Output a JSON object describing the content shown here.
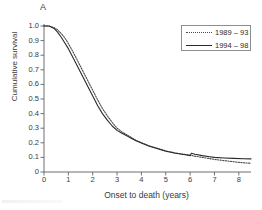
{
  "figure": {
    "panel_letter": "A"
  },
  "chart_data": {
    "type": "line",
    "title": "",
    "panel": "A",
    "xlabel": "Onset to death (years)",
    "ylabel": "Cumulative survival",
    "xlim": [
      0,
      8.5
    ],
    "ylim": [
      0,
      1.0
    ],
    "grid": false,
    "legend_position": "top-right",
    "xticks": [
      "0",
      "1",
      "2",
      "3",
      "4",
      "5",
      "6",
      "7",
      "8"
    ],
    "xtick_values": [
      0,
      1,
      2,
      3,
      4,
      5,
      6,
      7,
      8
    ],
    "yticks": [
      "0",
      "0.1",
      "0.2",
      "0.3",
      "0.4",
      "0.5",
      "0.6",
      "0.7",
      "0.8",
      "0.9",
      "1.0"
    ],
    "ytick_values": [
      0,
      0.1,
      0.2,
      0.3,
      0.4,
      0.5,
      0.6,
      0.7,
      0.8,
      0.9,
      1.0
    ],
    "series": [
      {
        "name": "1989 – 93",
        "style": "dotted",
        "color": "#4a4a4a",
        "x": [
          0,
          0.2,
          0.4,
          0.55,
          0.7,
          0.85,
          1.0,
          1.2,
          1.4,
          1.6,
          1.8,
          2.0,
          2.2,
          2.4,
          2.6,
          2.8,
          3.0,
          3.2,
          3.4,
          3.6,
          3.8,
          4.0,
          4.3,
          4.6,
          5.0,
          5.4,
          5.8,
          6.0,
          6.2,
          6.5,
          6.8,
          7.0,
          7.4,
          7.8,
          8.2,
          8.5
        ],
        "y": [
          1.0,
          1.0,
          0.99,
          0.975,
          0.95,
          0.92,
          0.88,
          0.82,
          0.755,
          0.69,
          0.625,
          0.56,
          0.495,
          0.435,
          0.385,
          0.34,
          0.3,
          0.275,
          0.255,
          0.235,
          0.215,
          0.2,
          0.18,
          0.165,
          0.145,
          0.13,
          0.12,
          0.115,
          0.108,
          0.1,
          0.092,
          0.086,
          0.078,
          0.07,
          0.063,
          0.06
        ]
      },
      {
        "name": "1994 – 98",
        "style": "solid",
        "color": "#2a2a2a",
        "x": [
          0,
          0.2,
          0.4,
          0.55,
          0.7,
          0.85,
          1.0,
          1.2,
          1.4,
          1.6,
          1.8,
          2.0,
          2.2,
          2.4,
          2.6,
          2.8,
          3.0,
          3.2,
          3.4,
          3.6,
          3.8,
          4.0,
          4.3,
          4.6,
          5.0,
          5.4,
          5.8,
          6.0,
          6.05,
          6.2,
          6.5,
          6.8,
          7.0,
          7.4,
          7.8,
          8.2,
          8.5
        ],
        "y": [
          1.0,
          1.0,
          0.985,
          0.96,
          0.925,
          0.885,
          0.845,
          0.78,
          0.715,
          0.65,
          0.585,
          0.52,
          0.455,
          0.4,
          0.355,
          0.315,
          0.285,
          0.265,
          0.248,
          0.23,
          0.212,
          0.198,
          0.178,
          0.162,
          0.142,
          0.128,
          0.118,
          0.112,
          0.128,
          0.122,
          0.112,
          0.105,
          0.1,
          0.096,
          0.093,
          0.091,
          0.09
        ]
      }
    ]
  }
}
